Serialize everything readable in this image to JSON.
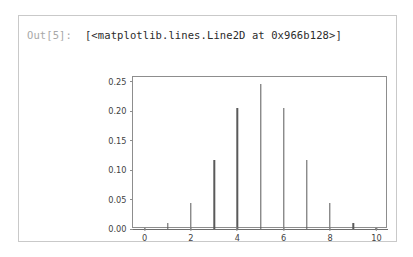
{
  "cell": {
    "prompt": "Out[5]:",
    "output_text": "[<matplotlib.lines.Line2D at 0x966b128>]"
  },
  "colors": {
    "cell_border": "#c9c9c9",
    "prompt_text": "#a8a8a8",
    "output_text": "#2b2b2b",
    "axes_spine": "#8d8d8d",
    "stem_line": "#5a5a5a",
    "baseline": "#6e6e6e",
    "tick_label": "#3f3f3f",
    "background": "#ffffff"
  },
  "chart_data": {
    "type": "bar",
    "title": "",
    "xlabel": "",
    "ylabel": "",
    "grid": false,
    "legend": null,
    "xlim": [
      -0.5,
      10.5
    ],
    "ylim": [
      0.0,
      0.2583
    ],
    "xticks": [
      0,
      2,
      4,
      6,
      8,
      10
    ],
    "xtick_labels": [
      "0",
      "2",
      "4",
      "6",
      "8",
      "10"
    ],
    "yticks": [
      0.0,
      0.05,
      0.1,
      0.15,
      0.2,
      0.25
    ],
    "ytick_labels": [
      "0.00",
      "0.05",
      "0.10",
      "0.15",
      "0.20",
      "0.25"
    ],
    "x": [
      0,
      1,
      2,
      3,
      4,
      5,
      6,
      7,
      8,
      9,
      10
    ],
    "values": [
      0.00098,
      0.00977,
      0.04395,
      0.11719,
      0.20508,
      0.24609,
      0.20508,
      0.11719,
      0.04395,
      0.00977,
      0.00098
    ],
    "baseline": 0.0
  }
}
